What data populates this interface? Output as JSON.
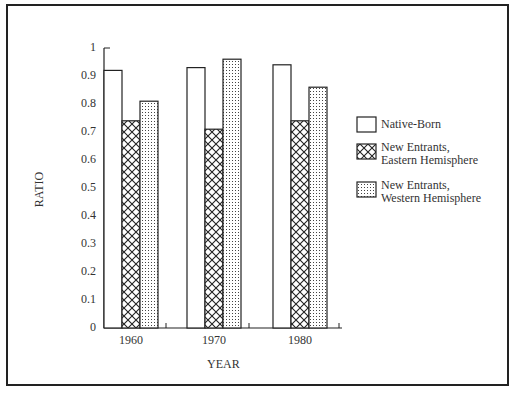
{
  "chart_data": {
    "type": "bar",
    "title": "",
    "xlabel": "YEAR",
    "ylabel": "RATIO",
    "categories": [
      "1960",
      "1970",
      "1980"
    ],
    "series": [
      {
        "name": "Native-Born",
        "pattern": "white",
        "values": [
          0.92,
          0.93,
          0.94
        ]
      },
      {
        "name": "New Entrants, Eastern Hemisphere",
        "pattern": "crosshatch",
        "values": [
          0.74,
          0.71,
          0.74
        ]
      },
      {
        "name": "New Entrants, Western Hemisphere",
        "pattern": "dotted",
        "values": [
          0.81,
          0.96,
          0.86
        ]
      }
    ],
    "ylim": [
      0,
      1
    ],
    "yticks": [
      "0",
      "0.1",
      "0.2",
      "0.3",
      "0.4",
      "0.5",
      "0.6",
      "0.7",
      "0.8",
      "0.9",
      "1"
    ],
    "grid": false,
    "legend_position": "right"
  },
  "legend": {
    "items": [
      {
        "line1": "Native-Born",
        "line2": ""
      },
      {
        "line1": "New Entrants,",
        "line2": "Eastern Hemisphere"
      },
      {
        "line1": "New Entrants,",
        "line2": "Western Hemisphere"
      }
    ]
  },
  "colors": {
    "ink": "#222222",
    "background": "#ffffff"
  }
}
